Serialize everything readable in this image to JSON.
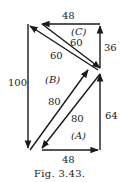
{
  "figure": {
    "caption": "Fig. 3.43.",
    "labels": {
      "top": "48",
      "bottom": "48",
      "left": "100",
      "right_upper": "36",
      "right_lower": "64",
      "diag_upper_outer": "60",
      "diag_upper_inner": "60",
      "diag_lower_outer": "80",
      "diag_lower_inner": "80",
      "region_a": "(A)",
      "region_b": "(B)",
      "region_c": "(C)"
    }
  }
}
